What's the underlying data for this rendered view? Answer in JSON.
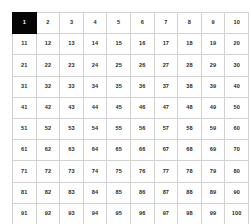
{
  "chart_data": {
    "type": "table",
    "rows": 10,
    "columns": 10,
    "grid": [
      [
        1,
        2,
        3,
        4,
        5,
        6,
        7,
        8,
        9,
        10
      ],
      [
        11,
        12,
        13,
        14,
        15,
        16,
        17,
        18,
        19,
        20
      ],
      [
        21,
        22,
        23,
        24,
        25,
        26,
        27,
        28,
        29,
        30
      ],
      [
        31,
        32,
        33,
        34,
        35,
        36,
        37,
        38,
        39,
        40
      ],
      [
        41,
        42,
        43,
        44,
        45,
        46,
        47,
        48,
        49,
        50
      ],
      [
        51,
        52,
        53,
        54,
        55,
        56,
        57,
        58,
        59,
        60
      ],
      [
        61,
        62,
        63,
        64,
        65,
        66,
        67,
        68,
        69,
        70
      ],
      [
        71,
        72,
        73,
        74,
        75,
        76,
        77,
        78,
        79,
        80
      ],
      [
        81,
        82,
        83,
        84,
        85,
        86,
        87,
        88,
        89,
        90
      ],
      [
        91,
        92,
        93,
        94,
        95,
        96,
        97,
        98,
        99,
        100
      ]
    ],
    "selected_cells": [
      1
    ],
    "xlabel": "",
    "ylabel": "",
    "legend": []
  },
  "colors": {
    "background": "#ffffff",
    "grid_line": "#d2d2d2",
    "cell_background": "#ffffff",
    "cell_text": "#2b2b2b",
    "selected_background": "#050505",
    "selected_text": "#ffffff"
  }
}
